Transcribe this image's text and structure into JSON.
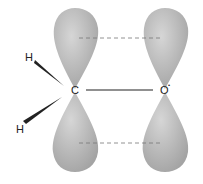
{
  "diagram": {
    "atoms": {
      "carbon": "C",
      "oxygen": "O",
      "oxygen_mark": "•",
      "hydrogen_top": "H",
      "hydrogen_bottom": "H"
    },
    "colors": {
      "lobe": "#a9a9a9",
      "lobe_highlight": "#d6d6d6",
      "bond": "#222222",
      "dash": "#777777"
    }
  }
}
